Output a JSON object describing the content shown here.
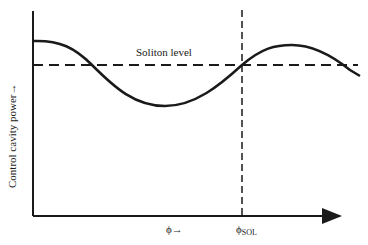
{
  "diagram": {
    "y_axis_label": "Control cavity power→",
    "x_axis_label": "ϕ→",
    "soliton_level_label": "Soliton level",
    "phi_sol_symbol": "ϕ",
    "phi_sol_subscript": "SOL",
    "colors": {
      "line": "#1a1a1a",
      "background": "#ffffff"
    }
  }
}
